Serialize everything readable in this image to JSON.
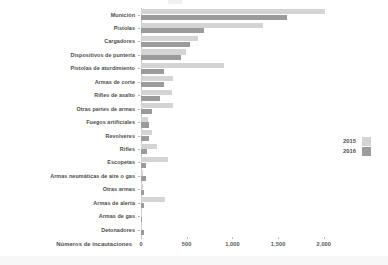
{
  "chart_data": {
    "type": "bar",
    "orientation": "horizontal",
    "title": "",
    "xlabel": "Números de incautaciones",
    "ylabel": "",
    "xlim": [
      0,
      2200
    ],
    "xticks": [
      0,
      500,
      1000,
      1500,
      2000
    ],
    "xtick_labels": [
      "0",
      "500",
      "1,000",
      "1,500",
      "2,000"
    ],
    "grid": false,
    "legend_position": "right",
    "categories": [
      "Munición",
      "Pistolas",
      "Cargadores",
      "Dispositivos de puntería",
      "Pistolas de aturdimiento",
      "Armas de corte",
      "Rifles de asalto",
      "Otras partes de armas",
      "Fuegos artificiales",
      "Revolveres",
      "Rifles",
      "Escopetas",
      "Armas neumáticas de aire o gas",
      "Otras armas",
      "Armas de alerta",
      "Armas de gas",
      "Detonadores"
    ],
    "series": [
      {
        "name": "2015",
        "color": "#d4d4d4",
        "values": [
          2010,
          1340,
          620,
          490,
          910,
          350,
          340,
          350,
          80,
          120,
          175,
          295,
          25,
          20,
          265,
          10,
          15
        ]
      },
      {
        "name": "2016",
        "color": "#9b9b9b",
        "values": [
          1600,
          690,
          535,
          440,
          255,
          250,
          205,
          120,
          90,
          90,
          65,
          55,
          55,
          35,
          30,
          12,
          30
        ]
      }
    ]
  },
  "legend": {
    "entries": [
      {
        "label": "2015",
        "swatch": "y2015"
      },
      {
        "label": "2016",
        "swatch": "y2016"
      }
    ]
  }
}
